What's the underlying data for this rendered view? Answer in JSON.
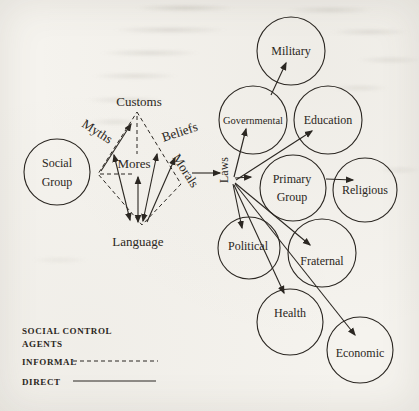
{
  "palette": {
    "bg": "#f5f3ee",
    "ink": "#2b2722"
  },
  "source_group": {
    "line1": "Social",
    "line2": "Group"
  },
  "informal_means": {
    "customs": "Customs",
    "myths": "Myths",
    "mores": "Mores",
    "beliefs": "Beliefs",
    "morals": "Morals",
    "language": "Language"
  },
  "hub": {
    "laws": "Laws"
  },
  "agents": [
    {
      "id": "military",
      "label": "Military"
    },
    {
      "id": "governmental",
      "label": "Governmental"
    },
    {
      "id": "education",
      "label": "Education"
    },
    {
      "id": "primary-group",
      "label": "Primary",
      "label2": "Group"
    },
    {
      "id": "religious",
      "label": "Religious"
    },
    {
      "id": "political",
      "label": "Political"
    },
    {
      "id": "fraternal",
      "label": "Fraternal"
    },
    {
      "id": "health",
      "label": "Health"
    },
    {
      "id": "economic",
      "label": "Economic"
    }
  ],
  "legend": {
    "title_line1": "SOCIAL CONTROL",
    "title_line2": "AGENTS",
    "items": [
      {
        "label": "INFORMAL",
        "style": "dashed"
      },
      {
        "label": "DIRECT",
        "style": "solid"
      }
    ]
  }
}
